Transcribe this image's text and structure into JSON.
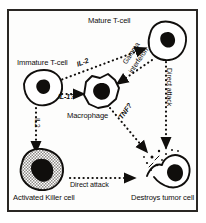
{
  "figure": {
    "type": "diagram",
    "border_color": "#2a2724",
    "background_color": "#fdfdfc",
    "ink_color": "#100e0c",
    "killer_cell_fill": "#b9b6b2"
  },
  "cells": {
    "immature_t_cell": {
      "label": "Immature T-cell",
      "shape": "rounded-polygon",
      "fill": "none",
      "nucleus": "solid-dark"
    },
    "mature_t_cell": {
      "label": "Mature T-cell",
      "shape": "lobed-blob",
      "fill": "none",
      "nucleus": "solid-dark"
    },
    "macrophage": {
      "label": "Macrophage",
      "shape": "spiky-polygon",
      "fill": "none",
      "nucleus": "solid-dark"
    },
    "activated_killer_cell": {
      "label": "Activated Killer cell",
      "shape": "lobed-blob",
      "fill": "stippled-gray",
      "nucleus": "solid-dark"
    },
    "tumor_cell": {
      "label": "Destroys tumor cell",
      "shape": "broken-blob-with-debris",
      "fill": "none",
      "nucleus": "solid-dark"
    }
  },
  "arrows": [
    {
      "id": "immature-to-macrophage",
      "label": "IL-1?",
      "from": "immature_t_cell",
      "to": "macrophage",
      "style": "dotted"
    },
    {
      "id": "macrophage-to-mature",
      "label": "IL-2",
      "from": "macrophage",
      "to": "mature_t_cell",
      "style": "dotted"
    },
    {
      "id": "mature-to-macrophage",
      "label": "Gamma interferon",
      "label_line1": "Gamma",
      "label_line2": "interferon",
      "from": "mature_t_cell",
      "to": "macrophage",
      "style": "dotted"
    },
    {
      "id": "mature-to-tumor",
      "label": "Direct attack",
      "from": "mature_t_cell",
      "to": "tumor_cell",
      "style": "dotted"
    },
    {
      "id": "macrophage-to-tumor",
      "label": "TNF?",
      "from": "macrophage",
      "to": "tumor_cell",
      "style": "dotted"
    },
    {
      "id": "immature-to-killer",
      "label": "IL2",
      "from": "immature_t_cell",
      "to": "activated_killer_cell",
      "style": "dotted"
    },
    {
      "id": "killer-to-tumor",
      "label": "Direct attack",
      "from": "activated_killer_cell",
      "to": "tumor_cell",
      "style": "dotted"
    }
  ]
}
